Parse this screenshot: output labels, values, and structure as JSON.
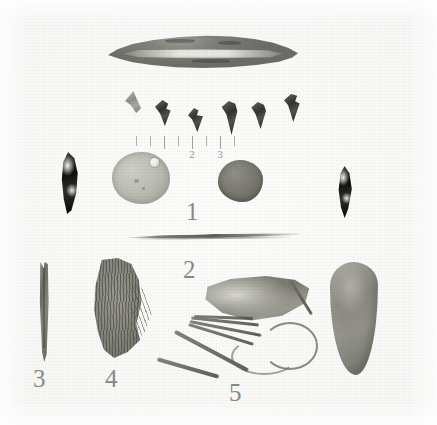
{
  "plate": {
    "title": "Archaeological artifact plate",
    "background_color": "#fbfbfa",
    "width": 437,
    "height": 425,
    "medium": "black-and-white photographic print"
  },
  "figure_labels": [
    {
      "id": "label-1",
      "text": "1",
      "x": 186,
      "y": 199,
      "size": "big"
    },
    {
      "id": "label-2",
      "text": "2",
      "x": 183,
      "y": 257,
      "size": "big"
    },
    {
      "id": "label-3",
      "text": "3",
      "x": 33,
      "y": 366,
      "size": "big"
    },
    {
      "id": "label-4",
      "text": "4",
      "x": 105,
      "y": 366,
      "size": "big"
    },
    {
      "id": "label-5",
      "text": "5",
      "x": 229,
      "y": 380,
      "size": "big"
    }
  ],
  "scale_ruler": {
    "name": "scale-ruler",
    "description": "faint graduated scale bar beneath the projectile point row",
    "tick_numbers": [
      "2",
      "3"
    ],
    "tick_positions_px": [
      0,
      14,
      28,
      42,
      56,
      70,
      84,
      98
    ],
    "numbered_ticks": [
      {
        "label": "2",
        "x": 56
      },
      {
        "label": "3",
        "x": 84
      }
    ],
    "unit_hint": "inches"
  },
  "artifacts": [
    {
      "key": "blade",
      "name": "lanceolate-biface-blade",
      "group": "1",
      "description": "large leaf-shaped chipped stone blade / lanceolate biface, mottled grey with a pale band across the middle",
      "tone": "mid grey"
    },
    {
      "key": "points",
      "name": "triangular-projectile-points",
      "group": "1",
      "count": 6,
      "description": "row of six small dark triangular arrow points of varying size",
      "tone": "dark grey to black"
    },
    {
      "key": "drill_left",
      "name": "dark-pointed-drill-left",
      "group": "1",
      "description": "dark narrow pointed chipped stone drill or perforator at the left of the disc row",
      "tone": "near black with bright flake scars"
    },
    {
      "key": "disc_pendant",
      "name": "perforated-disc-pendant",
      "group": "1",
      "description": "pale round stone or shell disc with a single drilled suspension hole near the upper right edge",
      "tone": "light grey"
    },
    {
      "key": "pebble_disc",
      "name": "dark-rounded-disc",
      "group": "1",
      "description": "smaller dark rounded disc or pebble, slightly irregular outline",
      "tone": "medium dark grey"
    },
    {
      "key": "drill_right",
      "name": "dark-pointed-drill-right",
      "group": "1",
      "description": "second dark narrow pointed chipped stone blade at the right edge of the disc row",
      "tone": "near black"
    },
    {
      "key": "needle",
      "name": "long-thin-bone-needle",
      "group": "2",
      "description": "very long slender flat splinter, a bone needle or sliver, lying nearly horizontal",
      "tone": "thin grey line"
    },
    {
      "key": "awl",
      "name": "bone-awl",
      "group": "3",
      "description": "narrow elongated bone awl or pin with a notched head and tapering tip",
      "tone": "mid grey"
    },
    {
      "key": "fiber",
      "name": "fiber-textile-fragment",
      "group": "4",
      "description": "ragged fibrous mass of twisted plant fiber or matting with loose strands on the right side",
      "tone": "dark grey, heavily textured"
    },
    {
      "key": "hide",
      "name": "hide-fragment-with-thongs",
      "group": "5",
      "description": "trapezoidal hide or leather fragment with several long curving thongs and a looped cord hanging below",
      "tone": "mid grey"
    },
    {
      "key": "mano",
      "name": "elongated-oval-groundstone",
      "group": "5",
      "description": "large smooth elongated oval ground stone, a mano or celt, at the lower right",
      "tone": "uniform mid grey"
    }
  ],
  "points_row": [
    {
      "index": 1,
      "size": "small",
      "tone": "light"
    },
    {
      "index": 2,
      "size": "medium",
      "tone": "dark"
    },
    {
      "index": 3,
      "size": "small",
      "tone": "dark"
    },
    {
      "index": 4,
      "size": "large",
      "tone": "dark"
    },
    {
      "index": 5,
      "size": "medium",
      "tone": "dark"
    },
    {
      "index": 6,
      "size": "medium",
      "tone": "dark"
    }
  ]
}
